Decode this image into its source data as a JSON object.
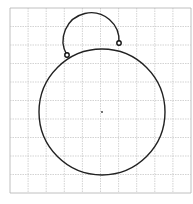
{
  "diagram": {
    "type": "geometric-construction",
    "grid": {
      "x0": 10,
      "y0": 8,
      "x1": 191,
      "y1": 193,
      "cols": 10,
      "rows": 10,
      "line_color": "#c8c8c8",
      "border_color": "#b0b0b0"
    },
    "big_circle": {
      "cx": 102,
      "cy": 112,
      "r": 63,
      "stroke": "#222222"
    },
    "center_point": {
      "x": 102,
      "y": 112
    },
    "small_arc": {
      "cx": 92,
      "cy": 47,
      "r": 28,
      "stroke": "#222222"
    },
    "points": [
      {
        "name": "left-intersection",
        "x": 67,
        "y": 55
      },
      {
        "name": "right-intersection",
        "x": 119,
        "y": 43
      }
    ]
  }
}
